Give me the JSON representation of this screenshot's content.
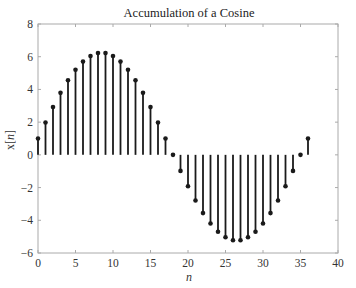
{
  "chart_data": {
    "type": "stem",
    "title": "Accumulation of a Cosine",
    "xlabel": "n",
    "ylabel": "x[n]",
    "xlim": [
      0,
      40
    ],
    "ylim": [
      -6,
      8
    ],
    "xticks": [
      0,
      5,
      10,
      15,
      20,
      25,
      30,
      35,
      40
    ],
    "yticks": [
      -6,
      -4,
      -2,
      0,
      2,
      4,
      6,
      8
    ],
    "grid": false,
    "legend": null,
    "x": [
      0,
      1,
      2,
      3,
      4,
      5,
      6,
      7,
      8,
      9,
      10,
      11,
      12,
      13,
      14,
      15,
      16,
      17,
      18,
      19,
      20,
      21,
      22,
      23,
      24,
      25,
      26,
      27,
      28,
      29,
      30,
      31,
      32,
      33,
      34,
      35,
      36
    ],
    "values": [
      1.0,
      1.98,
      2.92,
      3.79,
      4.56,
      5.2,
      5.7,
      6.04,
      6.22,
      6.22,
      6.04,
      5.7,
      5.2,
      4.56,
      3.79,
      2.92,
      1.98,
      1.0,
      0.0,
      -0.98,
      -1.92,
      -2.79,
      -3.56,
      -4.2,
      -4.7,
      -5.04,
      -5.22,
      -5.22,
      -5.04,
      -4.7,
      -4.2,
      -3.56,
      -2.79,
      -1.92,
      -0.98,
      0.0,
      1.0
    ],
    "colors": {
      "stem": "#1a1a1a",
      "axes": "#aaaaaa",
      "background": "#ffffff"
    }
  }
}
